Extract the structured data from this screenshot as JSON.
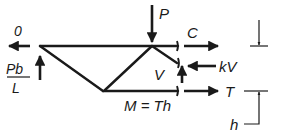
{
  "figure": {
    "type": "truss free-body diagram",
    "labels": {
      "left_horizontal_force": "0",
      "left_vertical_force_num": "Pb",
      "left_vertical_force_den": "L",
      "applied_load": "P",
      "top_chord_force": "C",
      "diagonal_vertical": "V",
      "diagonal_horizontal": "kV",
      "bottom_chord_force": "T",
      "moment_eq": "M = Th",
      "depth": "h"
    },
    "colors": {
      "ink": "#1a1a1a",
      "background": "#ffffff"
    }
  }
}
